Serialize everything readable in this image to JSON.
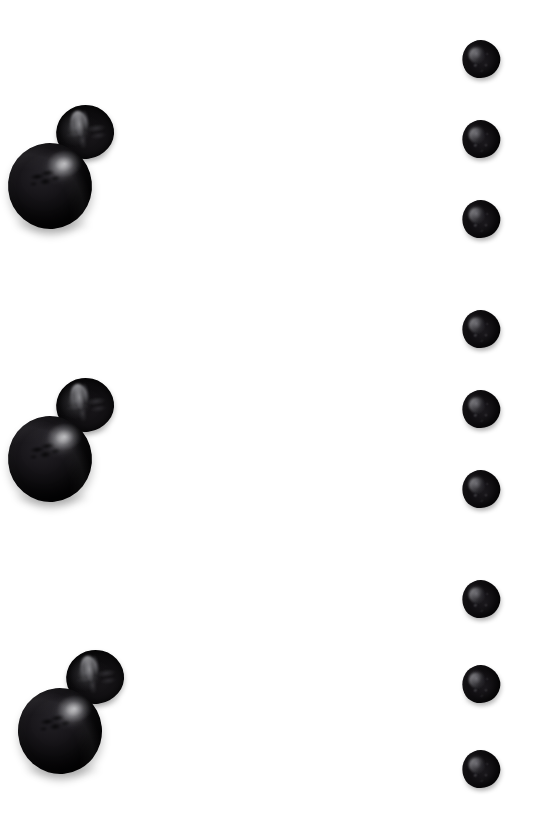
{
  "sheet": {
    "width": 552,
    "height": 817,
    "background_color": "#ffffff",
    "layout": "two-column specimen sheet",
    "title": ""
  },
  "palette": {
    "background": "#ffffff",
    "specimen_dark": "#0b0a0c",
    "specimen_shadow": "#161417",
    "specimen_highlight": "#d6d6da",
    "cast_shadow": "rgba(0,0,0,0.20)"
  },
  "left_column": {
    "name": "tomato-column",
    "item_count": 3,
    "items": [
      {
        "id": "tomato-group-1",
        "label": "Black tomato, whole and halved",
        "x": 4,
        "y": 105,
        "width": 140,
        "height": 150,
        "parts": [
          {
            "name": "whole-tomato",
            "label": "Whole black tomato"
          },
          {
            "name": "halved-tomato",
            "label": "Halved black tomato, cut face"
          }
        ]
      },
      {
        "id": "tomato-group-2",
        "label": "Black tomato, whole and halved",
        "x": 4,
        "y": 378,
        "width": 140,
        "height": 150,
        "parts": [
          {
            "name": "whole-tomato",
            "label": "Whole black tomato"
          },
          {
            "name": "halved-tomato",
            "label": "Halved black tomato, cut face"
          }
        ]
      },
      {
        "id": "tomato-group-3",
        "label": "Black tomato, whole and halved",
        "x": 14,
        "y": 650,
        "width": 140,
        "height": 150,
        "parts": [
          {
            "name": "whole-tomato",
            "label": "Whole black tomato"
          },
          {
            "name": "halved-tomato",
            "label": "Halved black tomato, cut face"
          }
        ]
      }
    ]
  },
  "right_column": {
    "name": "seed-column",
    "item_count": 9,
    "group_count": 3,
    "items_per_group": 3,
    "items": [
      {
        "id": "seed-1",
        "label": "Dark seed specimen",
        "x": 462,
        "y": 40,
        "group": 1
      },
      {
        "id": "seed-2",
        "label": "Dark seed specimen",
        "x": 462,
        "y": 120,
        "group": 1
      },
      {
        "id": "seed-3",
        "label": "Dark seed specimen",
        "x": 462,
        "y": 200,
        "group": 1
      },
      {
        "id": "seed-4",
        "label": "Dark seed specimen",
        "x": 462,
        "y": 310,
        "group": 2
      },
      {
        "id": "seed-5",
        "label": "Dark seed specimen",
        "x": 462,
        "y": 390,
        "group": 2
      },
      {
        "id": "seed-6",
        "label": "Dark seed specimen",
        "x": 462,
        "y": 470,
        "group": 2
      },
      {
        "id": "seed-7",
        "label": "Dark seed specimen",
        "x": 462,
        "y": 580,
        "group": 3
      },
      {
        "id": "seed-8",
        "label": "Dark seed specimen",
        "x": 462,
        "y": 665,
        "group": 3
      },
      {
        "id": "seed-9",
        "label": "Dark seed specimen",
        "x": 462,
        "y": 750,
        "group": 3
      }
    ]
  }
}
